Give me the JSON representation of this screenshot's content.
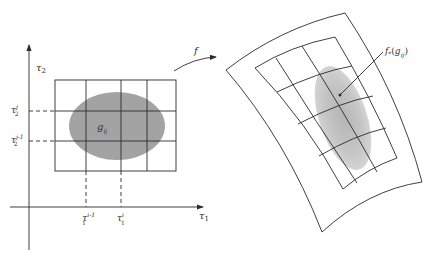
{
  "figure": {
    "domain_panel": {
      "axes": {
        "x_label": "τ",
        "x_sub": "1",
        "y_label": "τ",
        "y_sub": "2"
      },
      "y_ticks": [
        {
          "base": "τ",
          "sub": "2",
          "sup": "j"
        },
        {
          "base": "τ",
          "sub": "2",
          "sup": "j-1"
        }
      ],
      "x_ticks": [
        {
          "base": "τ",
          "sub": "1",
          "sup": "i-1"
        },
        {
          "base": "τ",
          "sub": "1",
          "sup": "i"
        }
      ],
      "region_label": {
        "base": "g",
        "sub": "ij"
      }
    },
    "map_arrow": {
      "label": "f"
    },
    "image_panel": {
      "region_label": {
        "prefix": "f",
        "star": "*",
        "open": "(",
        "base": "g",
        "sub": "ij",
        "close": ")"
      }
    },
    "colors": {
      "line": "#2a2a2a",
      "blob_left": "#9e9e9e",
      "blob_left_core": "#8a8a8a",
      "blob_right": "#c4c4c4",
      "background": "#ffffff"
    }
  }
}
